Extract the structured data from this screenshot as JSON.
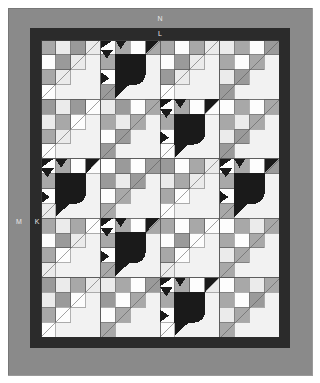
{
  "diagram": {
    "type": "quilt-layout",
    "canvas": {
      "width": 320,
      "height": 383,
      "background": "#ffffff"
    }
  },
  "labels": [
    {
      "id": "N",
      "text": "N",
      "target": "outer-border-top",
      "x": 160,
      "y": 19
    },
    {
      "id": "L",
      "text": "L",
      "target": "inner-border-top",
      "x": 160,
      "y": 34
    },
    {
      "id": "M",
      "text": "M",
      "target": "outer-border-left",
      "x": 19,
      "y": 222
    },
    {
      "id": "K",
      "text": "K",
      "target": "inner-border-left",
      "x": 37,
      "y": 222
    }
  ],
  "colors": {
    "outer_border": "#8a8a8a",
    "inner_border": "#2b2b2b",
    "background_light": "#f2f2f2",
    "patch_white": "#fdfdfd",
    "patch_light": "#ebebeb",
    "patch_gray": "#a8a8a8",
    "patch_midgray": "#9a9a9a",
    "patch_dark": "#1a1a1a",
    "seam_line": "#555555",
    "page_background": "#ffffff",
    "label_text": "#e8e8e8"
  },
  "geometry": {
    "outer_border_rect": {
      "x": 8,
      "y": 8,
      "width": 304,
      "height": 367
    },
    "inner_border_rect": {
      "x": 30,
      "y": 28,
      "width": 260,
      "height": 320
    },
    "quilt_field_rect": {
      "x": 41,
      "y": 40,
      "width": 238,
      "height": 297
    },
    "block_columns": 4,
    "block_rows": 5,
    "block_width": 59.5,
    "block_height": 59.4,
    "units_per_block": 4
  },
  "blocks": [
    {
      "row": 0,
      "col": 0,
      "type": "plain",
      "seed": 11
    },
    {
      "row": 0,
      "col": 1,
      "type": "motif",
      "seed": 12
    },
    {
      "row": 0,
      "col": 2,
      "type": "plain",
      "seed": 13
    },
    {
      "row": 0,
      "col": 3,
      "type": "plain",
      "seed": 14
    },
    {
      "row": 1,
      "col": 0,
      "type": "plain",
      "seed": 21
    },
    {
      "row": 1,
      "col": 1,
      "type": "plain",
      "seed": 22
    },
    {
      "row": 1,
      "col": 2,
      "type": "motif",
      "seed": 23
    },
    {
      "row": 1,
      "col": 3,
      "type": "plain",
      "seed": 24
    },
    {
      "row": 2,
      "col": 0,
      "type": "motif",
      "seed": 31
    },
    {
      "row": 2,
      "col": 1,
      "type": "plain",
      "seed": 32
    },
    {
      "row": 2,
      "col": 2,
      "type": "plain",
      "seed": 33
    },
    {
      "row": 2,
      "col": 3,
      "type": "motif",
      "seed": 34
    },
    {
      "row": 3,
      "col": 0,
      "type": "plain",
      "seed": 41
    },
    {
      "row": 3,
      "col": 1,
      "type": "motif",
      "seed": 42
    },
    {
      "row": 3,
      "col": 2,
      "type": "plain",
      "seed": 43
    },
    {
      "row": 3,
      "col": 3,
      "type": "plain",
      "seed": 44
    },
    {
      "row": 4,
      "col": 0,
      "type": "plain",
      "seed": 51
    },
    {
      "row": 4,
      "col": 1,
      "type": "plain",
      "seed": 52
    },
    {
      "row": 4,
      "col": 2,
      "type": "motif",
      "seed": 53
    },
    {
      "row": 4,
      "col": 3,
      "type": "plain",
      "seed": 54
    }
  ],
  "patch_shades": {
    "plain_block_checker": [
      "#fdfdfd",
      "#a8a8a8",
      "#ebebeb",
      "#9a9a9a"
    ],
    "motif_body": "#1a1a1a",
    "motif_eye": "#1a1a1a",
    "triangle_fill": "#f2f2f2"
  }
}
